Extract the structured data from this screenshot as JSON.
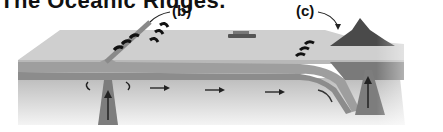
{
  "title": "The Oceanic Ridges.",
  "labels": {
    "b": "(b)",
    "c": "(c)"
  },
  "diagram": {
    "elements": [
      "oceanic crust plate",
      "mid-ocean ridge",
      "ship",
      "convection arrows",
      "subducting plate",
      "volcano",
      "magma plume"
    ]
  },
  "colors": {
    "ocean_surface": "#d6d6d6",
    "plate": "#a8a8a8",
    "mantle": "#c4c4c4",
    "dark": "#333333"
  }
}
